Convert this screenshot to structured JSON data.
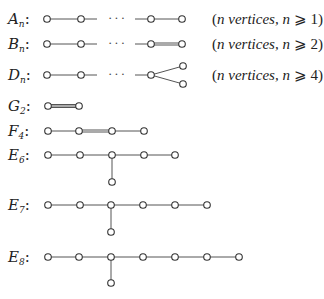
{
  "diagrams": [
    {
      "id": "A_n",
      "letter": "A",
      "subscript": "n",
      "y": 19,
      "note": {
        "prefix": "(",
        "italic": "n vertices, n",
        "rel": " ⩾ ",
        "value": "1)"
      },
      "nodes": [
        [
          47,
          19
        ],
        [
          81,
          19
        ],
        [
          151,
          19
        ],
        [
          182,
          19
        ]
      ],
      "edges": [
        {
          "from": [
            47,
            19
          ],
          "to": [
            97,
            19
          ],
          "type": "single"
        },
        {
          "from": [
            135,
            19
          ],
          "to": [
            182,
            19
          ],
          "type": "single"
        }
      ],
      "ellipsis": {
        "x": 108,
        "y": 22,
        "text": "···"
      }
    },
    {
      "id": "B_n",
      "letter": "B",
      "subscript": "n",
      "y": 44,
      "note": {
        "prefix": "(",
        "italic": "n vertices, n",
        "rel": " ⩾ ",
        "value": "2)"
      },
      "nodes": [
        [
          47,
          44
        ],
        [
          81,
          44
        ],
        [
          151,
          44
        ],
        [
          182,
          44
        ]
      ],
      "edges": [
        {
          "from": [
            47,
            44
          ],
          "to": [
            97,
            44
          ],
          "type": "single"
        },
        {
          "from": [
            135,
            44
          ],
          "to": [
            151,
            44
          ],
          "type": "single"
        },
        {
          "from": [
            151,
            44
          ],
          "to": [
            182,
            44
          ],
          "type": "double"
        }
      ],
      "ellipsis": {
        "x": 108,
        "y": 47,
        "text": "···"
      }
    },
    {
      "id": "D_n",
      "letter": "D",
      "subscript": "n",
      "y": 75,
      "note": {
        "prefix": "(",
        "italic": "n vertices, n",
        "rel": " ⩾ ",
        "value": "4)"
      },
      "nodes": [
        [
          47,
          75
        ],
        [
          81,
          75
        ],
        [
          151,
          75
        ],
        [
          183,
          66
        ],
        [
          183,
          84
        ]
      ],
      "edges": [
        {
          "from": [
            47,
            75
          ],
          "to": [
            97,
            75
          ],
          "type": "single"
        },
        {
          "from": [
            135,
            75
          ],
          "to": [
            151,
            75
          ],
          "type": "single"
        },
        {
          "from": [
            151,
            75
          ],
          "to": [
            183,
            66
          ],
          "type": "single"
        },
        {
          "from": [
            151,
            75
          ],
          "to": [
            183,
            84
          ],
          "type": "single"
        }
      ],
      "ellipsis": {
        "x": 108,
        "y": 78,
        "text": "···"
      }
    },
    {
      "id": "G_2",
      "letter": "G",
      "subscript": "2",
      "y": 106,
      "nodes": [
        [
          48,
          106
        ],
        [
          79,
          106
        ]
      ],
      "edges": [
        {
          "from": [
            48,
            106
          ],
          "to": [
            79,
            106
          ],
          "type": "triple"
        }
      ]
    },
    {
      "id": "F_4",
      "letter": "F",
      "subscript": "4",
      "y": 131,
      "nodes": [
        [
          48,
          131
        ],
        [
          79,
          131
        ],
        [
          112,
          131
        ],
        [
          144,
          131
        ]
      ],
      "edges": [
        {
          "from": [
            48,
            131
          ],
          "to": [
            79,
            131
          ],
          "type": "single"
        },
        {
          "from": [
            79,
            131
          ],
          "to": [
            112,
            131
          ],
          "type": "double"
        },
        {
          "from": [
            112,
            131
          ],
          "to": [
            144,
            131
          ],
          "type": "single"
        }
      ]
    },
    {
      "id": "E_6",
      "letter": "E",
      "subscript": "6",
      "y": 155,
      "nodes": [
        [
          48,
          155
        ],
        [
          80,
          155
        ],
        [
          112,
          155
        ],
        [
          144,
          155
        ],
        [
          175,
          155
        ],
        [
          112,
          182
        ]
      ],
      "edges": [
        {
          "from": [
            48,
            155
          ],
          "to": [
            175,
            155
          ],
          "type": "single"
        },
        {
          "from": [
            112,
            155
          ],
          "to": [
            112,
            182
          ],
          "type": "single"
        }
      ]
    },
    {
      "id": "E_7",
      "letter": "E",
      "subscript": "7",
      "y": 205,
      "nodes": [
        [
          48,
          205
        ],
        [
          80,
          205
        ],
        [
          111,
          205
        ],
        [
          143,
          205
        ],
        [
          175,
          205
        ],
        [
          207,
          205
        ],
        [
          111,
          232
        ]
      ],
      "edges": [
        {
          "from": [
            48,
            205
          ],
          "to": [
            207,
            205
          ],
          "type": "single"
        },
        {
          "from": [
            111,
            205
          ],
          "to": [
            111,
            232
          ],
          "type": "single"
        }
      ]
    },
    {
      "id": "E_8",
      "letter": "E",
      "subscript": "8",
      "y": 257,
      "nodes": [
        [
          48,
          257
        ],
        [
          79,
          257
        ],
        [
          111,
          257
        ],
        [
          143,
          257
        ],
        [
          175,
          257
        ],
        [
          207,
          257
        ],
        [
          239,
          257
        ],
        [
          111,
          283
        ]
      ],
      "edges": [
        {
          "from": [
            48,
            257
          ],
          "to": [
            239,
            257
          ],
          "type": "single"
        },
        {
          "from": [
            111,
            257
          ],
          "to": [
            111,
            283
          ],
          "type": "single"
        }
      ]
    }
  ],
  "style": {
    "node_radius": 3.3,
    "edge_color": "#555555",
    "node_stroke": "#333333"
  }
}
